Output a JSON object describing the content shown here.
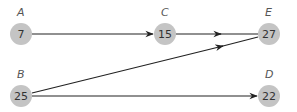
{
  "diagram": {
    "type": "directed-graph",
    "colors": {
      "node_fill": "#c4c4c4",
      "edge": "#222222",
      "label": "#555555",
      "value": "#333333"
    },
    "nodes": [
      {
        "id": "A",
        "label": "A",
        "value": "7",
        "x": 21,
        "y": 34
      },
      {
        "id": "B",
        "label": "B",
        "value": "25",
        "x": 21,
        "y": 96
      },
      {
        "id": "C",
        "label": "C",
        "value": "15",
        "x": 165,
        "y": 34
      },
      {
        "id": "E",
        "label": "E",
        "value": "27",
        "x": 269,
        "y": 34
      },
      {
        "id": "D",
        "label": "D",
        "value": "22",
        "x": 269,
        "y": 96
      }
    ],
    "edges": [
      {
        "from": "A",
        "to": "C"
      },
      {
        "from": "C",
        "to": "E"
      },
      {
        "from": "B",
        "to": "E"
      },
      {
        "from": "B",
        "to": "D"
      }
    ]
  }
}
